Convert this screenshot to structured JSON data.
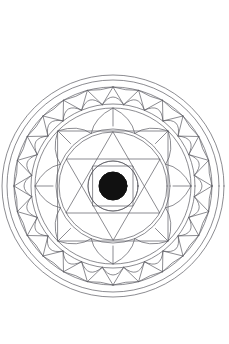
{
  "image": {
    "title": "Mandala Line Drawing",
    "description": "Black-and-white geometric mandala coloring page on white background",
    "width": 229,
    "height": 344,
    "background_color": "#ffffff",
    "stroke_color": "#4a4a52",
    "fill_color": "#111111"
  },
  "mandala": {
    "center_x": 113,
    "center_y": 186,
    "stroke_width": 0.7,
    "rings": [
      {
        "name": "outer-rim-circle",
        "radius": 111,
        "stroke": "#5a5a62",
        "fill": "none"
      },
      {
        "name": "outer-rim-inner-circle",
        "radius": 106,
        "stroke": "#5a5a62",
        "fill": "none"
      },
      {
        "name": "triangle-band-outer-circle",
        "radius": 99,
        "stroke": "#5a5a62",
        "fill": "none"
      },
      {
        "name": "triangle-band-inner-circle",
        "radius": 82,
        "stroke": "#5a5a62",
        "fill": "none"
      },
      {
        "name": "lotus-band-outer-circle",
        "radius": 78,
        "stroke": "#5a5a62",
        "fill": "none"
      },
      {
        "name": "lotus-band-inner-circle",
        "radius": 57,
        "stroke": "#5a5a62",
        "fill": "none"
      },
      {
        "name": "hexagram-enclosing-circle",
        "radius": 54,
        "stroke": "#5a5a62",
        "fill": "none"
      },
      {
        "name": "inner-core-circle",
        "radius": 25,
        "stroke": "#5a5a62",
        "fill": "none"
      },
      {
        "name": "center-disc",
        "radius": 14,
        "stroke": "#111111",
        "fill": "#111111"
      }
    ],
    "triangle_band": {
      "name": "outer-triangle-spike-band",
      "count": 24,
      "outer_radius": 99,
      "inner_radius": 82,
      "description": "Ring of inward pointing triangles alternating with arcs"
    },
    "lotus_band": {
      "name": "lotus-petal-band",
      "count": 8,
      "outer_radius": 78,
      "inner_radius": 57,
      "description": "Eight pointed lotus petals radiating outward"
    },
    "square": {
      "name": "inscribed-square",
      "half_side": 55,
      "rotation_deg": 0,
      "stroke": "#5a5a62"
    },
    "hexagram": {
      "name": "hexagram-star",
      "circumradius": 54,
      "triangles": 2,
      "rotation_deg": 0,
      "stroke": "#5a5a62"
    },
    "inner_square": {
      "name": "inner-square",
      "half_side": 20,
      "stroke": "#5a5a62"
    }
  }
}
